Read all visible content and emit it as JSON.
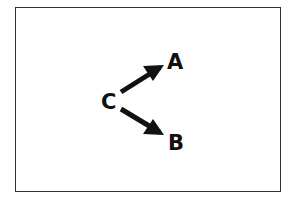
{
  "diagram": {
    "frame": {
      "border_color": "#333333"
    },
    "nodes": [
      {
        "id": "C",
        "label": "C",
        "x": 101,
        "y": 92
      },
      {
        "id": "A",
        "label": "A",
        "x": 167,
        "y": 52
      },
      {
        "id": "B",
        "label": "B",
        "x": 168,
        "y": 133
      }
    ],
    "edges": [
      {
        "from": "C",
        "to": "A",
        "tail": [
          121,
          92
        ],
        "tip": [
          164,
          65
        ]
      },
      {
        "from": "C",
        "to": "B",
        "tail": [
          121,
          109
        ],
        "tip": [
          164,
          135
        ]
      }
    ],
    "ink_color": "#111111"
  }
}
